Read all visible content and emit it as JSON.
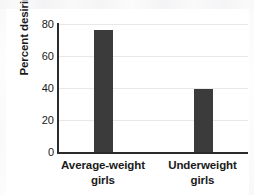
{
  "chart_data": {
    "type": "bar",
    "title": "",
    "subtitle": "",
    "xlabel": "",
    "ylabel": "Percent desiring to be smaller",
    "ylabel_lines": [
      "Percent desiring",
      "to be smaller"
    ],
    "categories": [
      "Average-weight girls",
      "Underweight girls"
    ],
    "category_lines": [
      [
        "Average-weight",
        "girls"
      ],
      [
        "Underweight",
        "girls"
      ]
    ],
    "values": [
      76,
      40
    ],
    "ylim": [
      0,
      80
    ],
    "yticks": [
      0,
      20,
      40,
      60,
      80
    ],
    "ytick_labels": [
      "0",
      "20",
      "40",
      "60",
      "80"
    ],
    "grid": true,
    "grid_axis": "y",
    "legend": false,
    "bar_color": "#3b3b3b",
    "grid_color": "#e8e8ea",
    "axis_color": "#2b2b2b",
    "text_color": "#1a1a1a",
    "background": "#ffffff"
  }
}
